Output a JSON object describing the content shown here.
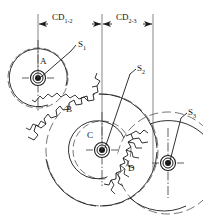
{
  "figure": {
    "type": "engineering-gear-train-diagram",
    "background_color": "#ffffff",
    "line_color": "#1a1a1a",
    "width": 203,
    "height": 218
  },
  "dimensions": [
    {
      "id": "cd12",
      "label": "CD",
      "subscript": "1-2",
      "label_x": 52,
      "label_y": 19,
      "line_y": 24,
      "from_x": 38,
      "to_x": 102
    },
    {
      "id": "cd23",
      "label": "CD",
      "subscript": "2-3",
      "label_x": 114,
      "label_y": 19,
      "line_y": 24,
      "from_x": 102,
      "to_x": 153
    }
  ],
  "extension_lines": [
    {
      "id": "ext-1",
      "x": 38,
      "y1": 14,
      "y2": 78
    },
    {
      "id": "ext-2",
      "x": 102,
      "y1": 14,
      "y2": 150
    },
    {
      "id": "ext-3",
      "x": 153,
      "y1": 14,
      "y2": 170
    }
  ],
  "gears": [
    {
      "id": "gear-a",
      "label": "A",
      "label_x": 43,
      "label_y": 62,
      "center_x": 38,
      "center_y": 78,
      "pitch_radius": 28,
      "outer_radius": 32
    },
    {
      "id": "gear-b",
      "label": "B",
      "label_x": 68,
      "label_y": 110,
      "center_x": 102,
      "center_y": 150,
      "pitch_radius": 52,
      "outer_radius": 57
    },
    {
      "id": "gear-c",
      "label": "C",
      "label_x": 89,
      "label_y": 136,
      "center_x": 102,
      "center_y": 150,
      "pitch_radius": 27,
      "outer_radius": 31
    },
    {
      "id": "gear-d",
      "label": "D",
      "label_x": 130,
      "label_y": 170,
      "center_x": 168,
      "center_y": 163,
      "pitch_radius": 48,
      "outer_radius": 52
    }
  ],
  "shafts": [
    {
      "id": "shaft-1",
      "label": "S",
      "subscript": "1",
      "label_x": 76,
      "label_y": 46,
      "leader_from_x": 73,
      "leader_from_y": 51,
      "leader_to_x": 41,
      "leader_to_y": 77,
      "hub_x": 38,
      "hub_y": 78
    },
    {
      "id": "shaft-2",
      "label": "S",
      "subscript": "2",
      "label_x": 135,
      "label_y": 70,
      "leader_from_x": 132,
      "leader_from_y": 74,
      "leader_to_x": 105,
      "leader_to_y": 148,
      "hub_x": 102,
      "hub_y": 150
    },
    {
      "id": "shaft-3",
      "label": "S",
      "subscript": "3",
      "label_x": 186,
      "label_y": 114,
      "leader_from_x": 183,
      "leader_from_y": 118,
      "leader_to_x": 170,
      "leader_to_y": 161,
      "hub_x": 168,
      "hub_y": 163
    }
  ]
}
